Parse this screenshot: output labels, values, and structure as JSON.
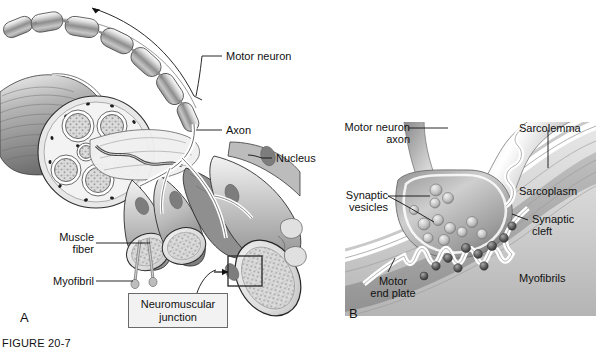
{
  "figure": {
    "caption": "FIGURE 20-7",
    "panels": [
      {
        "id": "A",
        "label": "A"
      },
      {
        "id": "B",
        "label": "B"
      }
    ]
  },
  "panel_a": {
    "id_label": "A",
    "labels": {
      "motor_neuron": "Motor neuron",
      "axon": "Axon",
      "nucleus": "Nucleus",
      "muscle_fiber": "Muscle\nfiber",
      "myofibril": "Myofibril",
      "neuromuscular_junction": "Neuromuscular\njunction"
    }
  },
  "panel_b": {
    "id_label": "B",
    "labels": {
      "motor_neuron_axon": "Motor neuron\naxon",
      "synaptic_vesicles": "Synaptic\nvesicles",
      "motor_end_plate": "Motor\nend plate",
      "sarcolemma": "Sarcolemma",
      "sarcoplasm": "Sarcoplasm",
      "synaptic_cleft": "Synaptic\ncleft",
      "myofibrils": "Myofibrils"
    }
  },
  "colors": {
    "background": "#ffffff",
    "ink": "#111111",
    "leader_line": "#1a1a1a",
    "tissue_light": "#e2e2e2",
    "tissue_mid": "#b9b9b9",
    "tissue_dark": "#8a8a8a",
    "tissue_darkest": "#5f5f5f",
    "box_fill": "#f2f2f2",
    "box_border": "#6a6a6a",
    "sarcoplasm": "#d6d6d6",
    "myofibril_band": "#b0b0b0"
  }
}
